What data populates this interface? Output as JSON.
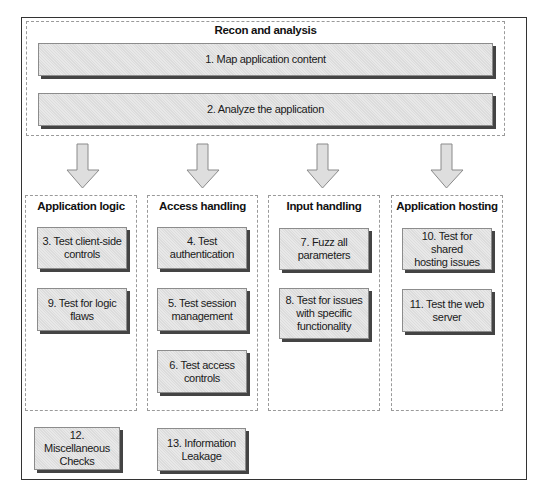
{
  "diagram": {
    "recon_group": {
      "title": "Recon and analysis",
      "steps": [
        {
          "label": "1. Map application content"
        },
        {
          "label": "2. Analyze the application"
        }
      ]
    },
    "columns": [
      {
        "title": "Application logic",
        "steps": [
          {
            "label": "3. Test client-side\ncontrols"
          },
          {
            "label": "9. Test for logic\nflaws"
          }
        ]
      },
      {
        "title": "Access handling",
        "steps": [
          {
            "label": "4. Test\nauthentication"
          },
          {
            "label": "5. Test session\nmanagement"
          },
          {
            "label": "6. Test access\ncontrols"
          }
        ]
      },
      {
        "title": "Input handling",
        "steps": [
          {
            "label": "7. Fuzz all\nparameters"
          },
          {
            "label": "8. Test for issues\nwith specific\nfunctionality"
          }
        ]
      },
      {
        "title": "Application hosting",
        "steps": [
          {
            "label": "10. Test for shared\nhosting issues"
          },
          {
            "label": "11. Test the web\nserver"
          }
        ]
      }
    ],
    "standalone_steps": [
      {
        "label": "12. Miscellaneous\nChecks"
      },
      {
        "label": "13. Information\nLeakage"
      }
    ],
    "arrows": [
      {
        "icon": "down-arrow-icon",
        "target": "Application logic"
      },
      {
        "icon": "down-arrow-icon",
        "target": "Access handling"
      },
      {
        "icon": "down-arrow-icon",
        "target": "Input handling"
      },
      {
        "icon": "down-arrow-icon",
        "target": "Application hosting"
      }
    ],
    "colors": {
      "box_fill": "#e3e3e3",
      "box_border": "#8c8c8c",
      "box_shadow": "#444444",
      "dashed_border": "#9a9a9a",
      "frame_border": "#333333",
      "arrow_fill": "#dedede",
      "arrow_stroke": "#8a8a8a"
    }
  }
}
